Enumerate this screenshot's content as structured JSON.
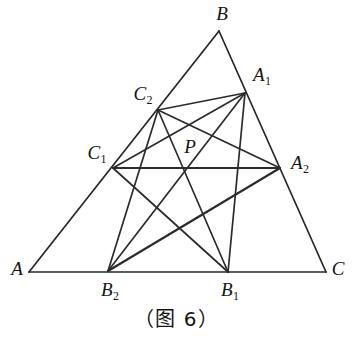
{
  "figure": {
    "caption": "（图 6）",
    "stroke_color": "#262626",
    "background_color": "#ffffff",
    "points": {
      "A": {
        "label": "A",
        "sub": "",
        "x": 29,
        "y": 272,
        "label_x": 17,
        "label_y": 268
      },
      "B": {
        "label": "B",
        "sub": "",
        "x": 219,
        "y": 31,
        "label_x": 222,
        "label_y": 13
      },
      "C": {
        "label": "C",
        "sub": "",
        "x": 326,
        "y": 272,
        "label_x": 338,
        "label_y": 268
      },
      "A1": {
        "label": "A",
        "sub": "1",
        "x": 245,
        "y": 93,
        "label_x": 262,
        "label_y": 76
      },
      "A2": {
        "label": "A",
        "sub": "2",
        "x": 280,
        "y": 168,
        "label_x": 300,
        "label_y": 164
      },
      "B1": {
        "label": "B",
        "sub": "1",
        "x": 228,
        "y": 272,
        "label_x": 230,
        "label_y": 291
      },
      "B2": {
        "label": "B",
        "sub": "2",
        "x": 108,
        "y": 271,
        "label_x": 110,
        "label_y": 291
      },
      "C1": {
        "label": "C",
        "sub": "1",
        "x": 113,
        "y": 168,
        "label_x": 97,
        "label_y": 154
      },
      "C2": {
        "label": "C",
        "sub": "2",
        "x": 158,
        "y": 110,
        "label_x": 143,
        "label_y": 95
      },
      "P": {
        "label": "P",
        "sub": "",
        "x": 186,
        "y": 169,
        "label_x": 190,
        "label_y": 146
      }
    },
    "triangle_sides": [
      {
        "name": "side-AB",
        "from": "A",
        "to": "B"
      },
      {
        "name": "side-BC",
        "from": "B",
        "to": "C"
      },
      {
        "name": "side-CA",
        "from": "C",
        "to": "A"
      }
    ],
    "chords": [
      {
        "name": "chord-C1-A2",
        "from": "C1",
        "to": "A2",
        "emphasis": "thick"
      },
      {
        "name": "chord-C2-A1",
        "from": "C2",
        "to": "A1",
        "emphasis": "normal"
      },
      {
        "name": "chord-C1-A1",
        "from": "C1",
        "to": "A1",
        "emphasis": "normal"
      },
      {
        "name": "chord-C2-A2",
        "from": "C2",
        "to": "A2",
        "emphasis": "normal"
      },
      {
        "name": "chord-C1-B1",
        "from": "C1",
        "to": "B1",
        "emphasis": "normal"
      },
      {
        "name": "chord-C2-B1",
        "from": "C2",
        "to": "B1",
        "emphasis": "normal"
      },
      {
        "name": "chord-C2-B2",
        "from": "C2",
        "to": "B2",
        "emphasis": "normal"
      },
      {
        "name": "chord-A1-B2",
        "from": "A1",
        "to": "B2",
        "emphasis": "normal"
      },
      {
        "name": "chord-A1-B1",
        "from": "A1",
        "to": "B1",
        "emphasis": "normal"
      },
      {
        "name": "chord-A2-B2",
        "from": "A2",
        "to": "B2",
        "emphasis": "thick"
      }
    ]
  }
}
